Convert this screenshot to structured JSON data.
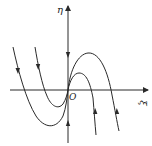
{
  "diagram": {
    "type": "phase-portrait",
    "axes": {
      "horizontal_label": "ξ",
      "vertical_label": "η",
      "origin_label": "O"
    },
    "trajectories": [
      {
        "name": "outer",
        "direction": "down on left branch, up on right branch"
      },
      {
        "name": "inner",
        "direction": "down on left branch, up on right branch"
      }
    ],
    "axis_flow": {
      "positive_eta": "downward toward origin",
      "negative_eta": "upward toward origin"
    },
    "colors": {
      "stroke": "#2a2a2a",
      "background": "#ffffff"
    }
  }
}
